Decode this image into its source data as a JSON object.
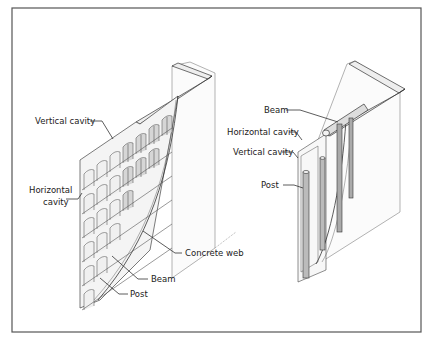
{
  "figure": {
    "left_panel": {
      "name": "Grid block wall",
      "labels": {
        "vertical_cavity": "Vertical cavity",
        "horizontal_cavity_line1": "Horizontal",
        "horizontal_cavity_line2": "cavity",
        "concrete_web": "Concrete web",
        "beam": "Beam",
        "post": "Post"
      }
    },
    "right_panel": {
      "name": "Post and beam wall",
      "labels": {
        "beam": "Beam",
        "horizontal_cavity": "Horizontal cavity",
        "vertical_cavity": "Vertical cavity",
        "post": "Post"
      }
    }
  }
}
